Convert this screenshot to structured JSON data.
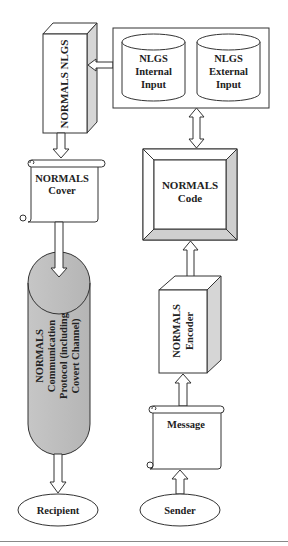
{
  "diagram": {
    "title": "",
    "nodes": {
      "nlgs": {
        "label": "NORMALS NLGS",
        "shape": "3d-box"
      },
      "inputs": {
        "shape": "container",
        "internal": {
          "lines": [
            "NLGS",
            "Internal",
            "Input"
          ],
          "shape": "cylinder"
        },
        "external": {
          "lines": [
            "NLGS",
            "External",
            "Input"
          ],
          "shape": "cylinder"
        }
      },
      "cover": {
        "lines": [
          "NORMALS",
          "Cover"
        ],
        "shape": "scroll"
      },
      "code": {
        "lines": [
          "NORMALS",
          "Code"
        ],
        "shape": "beveled-box"
      },
      "protocol": {
        "lines": [
          "NORMALS",
          "Communication",
          "Protocol (including",
          "Covert Channel)"
        ],
        "shape": "capsule"
      },
      "encoder": {
        "lines": [
          "NORMALS",
          "Encoder"
        ],
        "shape": "3d-box"
      },
      "message": {
        "label": "Message",
        "shape": "scroll"
      },
      "recipient": {
        "label": "Recipient",
        "shape": "ellipse"
      },
      "sender": {
        "label": "Sender",
        "shape": "ellipse"
      }
    },
    "edges": [
      {
        "from": "inputs",
        "to": "nlgs",
        "type": "arrow"
      },
      {
        "from": "nlgs",
        "to": "cover",
        "type": "arrow"
      },
      {
        "from": "cover",
        "to": "protocol",
        "type": "arrow"
      },
      {
        "from": "protocol",
        "to": "recipient",
        "type": "arrow"
      },
      {
        "from": "inputs",
        "to": "code",
        "type": "double-arrow"
      },
      {
        "from": "code",
        "to": "encoder",
        "type": "double-arrow"
      },
      {
        "from": "message",
        "to": "encoder",
        "type": "arrow"
      },
      {
        "from": "sender",
        "to": "message",
        "type": "arrow"
      }
    ],
    "colors": {
      "stroke": "#333333",
      "shade": "#d6d6d6",
      "capsule_fill": "#bdbdbd",
      "background": "#ffffff"
    }
  }
}
